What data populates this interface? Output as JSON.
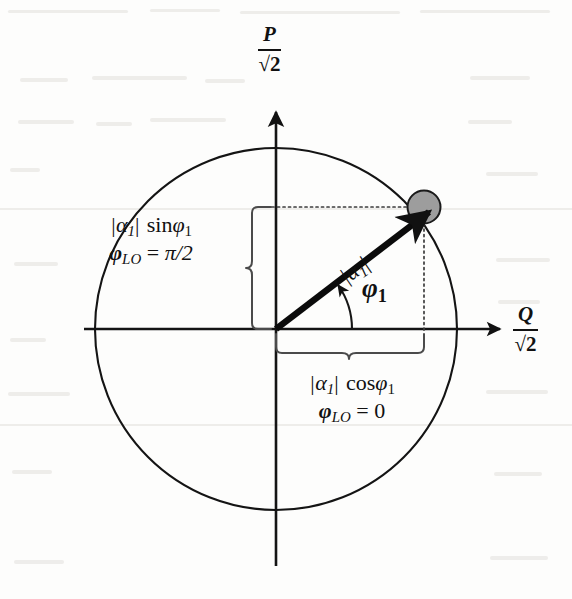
{
  "figure": {
    "background_color": "#fdfdfc",
    "ink_color": "#111111",
    "disc_fill_color": "#9a9a9a",
    "disc_stroke_color": "#111111",
    "guide_color": "#555555"
  },
  "axes": {
    "vertical": {
      "numerator": "P",
      "denominator": "√2",
      "label_plain": "P/√2",
      "direction": "up"
    },
    "horizontal": {
      "numerator": "Q",
      "denominator": "√2",
      "label_plain": "Q/√2",
      "direction": "right"
    }
  },
  "vector": {
    "magnitude_label": "|α₁|",
    "magnitude_base": "|α",
    "magnitude_sub": "1",
    "magnitude_close": "|",
    "angle_label": "φ₁",
    "angle_base": "φ",
    "angle_sub": "1",
    "angle_degrees": 34.5
  },
  "projections": {
    "vertical_component": {
      "line1_parts": {
        "abs_open": "|α",
        "abs_sub": "1",
        "abs_close": "|",
        "func": "sin",
        "arg": "φ",
        "arg_sub": "1"
      },
      "line1_plain": "|α₁| sinφ₁",
      "line2_parts": {
        "phi": "φ",
        "phi_sub": "LO",
        "eq": "=",
        "value": "π/2"
      },
      "line2_plain": "φ_LO = π/2"
    },
    "horizontal_component": {
      "line1_parts": {
        "abs_open": "|α",
        "abs_sub": "1",
        "abs_close": "|",
        "func": "cos",
        "arg": "φ",
        "arg_sub": "1"
      },
      "line1_plain": "|α₁| cosφ₁",
      "line2_parts": {
        "phi": "φ",
        "phi_sub": "LO",
        "eq": "=",
        "value": "0"
      },
      "line2_plain": "φ_LO = 0"
    }
  },
  "elements": {
    "uncertainty_disc_name": "uncertainty-disc",
    "circle_name": "amplitude-circle",
    "vector_name": "alpha-vector",
    "vertical_brace_name": "vertical-projection-brace",
    "horizontal_brace_name": "horizontal-projection-brace"
  }
}
